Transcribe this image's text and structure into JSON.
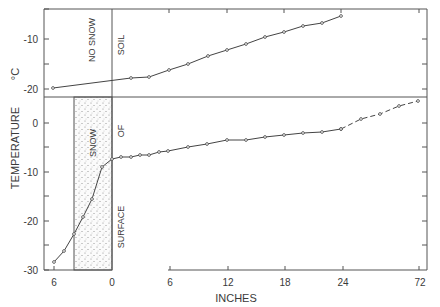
{
  "chart_data": {
    "type": "line",
    "title": "",
    "xlabel": "INCHES",
    "ylabel": "TEMPERATURE °C",
    "grid": false,
    "legend": null,
    "panels": [
      {
        "name": "no-snow",
        "ylim": [
          -24,
          -4
        ],
        "yticks": [
          -10,
          -20
        ],
        "ytick_labels": [
          "-10",
          "-20"
        ],
        "annotations": [
          "NO SNOW",
          "SOIL"
        ],
        "series": [
          {
            "name": "Temperature profile, no snow cover",
            "style": "solid",
            "x": [
              -6,
              2,
              4,
              6,
              8,
              10,
              12,
              14,
              16,
              18,
              20,
              22,
              24
            ],
            "values": [
              -19.8,
              -17.8,
              -17.6,
              -16.2,
              -15.0,
              -13.4,
              -12.2,
              -11.0,
              -9.6,
              -8.6,
              -7.4,
              -6.8,
              -5.4
            ]
          }
        ]
      },
      {
        "name": "with-snow",
        "ylim": [
          -30,
          3
        ],
        "yticks": [
          0,
          -10,
          -20,
          -30
        ],
        "ytick_labels": [
          "0",
          "-10",
          "-20",
          "-30"
        ],
        "annotations": [
          "SNOW",
          "SURFACE OF SOIL"
        ],
        "snow_region_inches": [
          -4,
          0
        ],
        "series": [
          {
            "name": "Temperature profile, snow cover",
            "style": "solid",
            "x": [
              -6,
              -5,
              -4,
              -3,
              -2,
              -1,
              0,
              1,
              2,
              3,
              4,
              5,
              6,
              8,
              10,
              12,
              14,
              16,
              18,
              20,
              22,
              24
            ],
            "values": [
              -28.4,
              -26.1,
              -22.7,
              -19.2,
              -15.5,
              -9.0,
              -7.3,
              -6.9,
              -6.9,
              -6.5,
              -6.5,
              -5.9,
              -5.7,
              -4.9,
              -4.3,
              -3.5,
              -3.5,
              -2.9,
              -2.4,
              -2.0,
              -1.8,
              -1.2
            ]
          },
          {
            "name": "Temperature profile, snow cover (extrapolated)",
            "style": "dashed",
            "x": [
              24,
              36,
              48,
              60,
              72
            ],
            "values": [
              -1.2,
              0.8,
              1.8,
              3.5,
              4.5
            ]
          }
        ]
      }
    ],
    "x_tick_labels_left": [
      "6",
      "0"
    ],
    "x_tick_labels_right": [
      "6",
      "12",
      "18",
      "24",
      "72"
    ]
  },
  "labels": {
    "y_axis": "TEMPERATURE",
    "y_unit": "°C",
    "x_axis": "INCHES",
    "no_snow": "NO SNOW",
    "soil": "SOIL",
    "snow": "SNOW",
    "of": "OF",
    "surface": "SURFACE"
  },
  "geometry": {
    "top_points": [
      [
        53,
        88
      ],
      [
        131,
        78
      ],
      [
        149,
        77
      ],
      [
        169,
        70
      ],
      [
        188,
        64
      ],
      [
        208,
        56
      ],
      [
        227,
        50
      ],
      [
        246,
        44
      ],
      [
        265,
        37
      ],
      [
        284,
        32
      ],
      [
        303,
        26
      ],
      [
        322,
        23
      ],
      [
        341,
        16
      ]
    ],
    "bottom_points": [
      [
        54,
        262
      ],
      [
        64,
        251
      ],
      [
        74,
        234
      ],
      [
        83,
        217
      ],
      [
        92,
        199
      ],
      [
        102,
        167
      ],
      [
        112,
        159
      ],
      [
        121,
        157
      ],
      [
        131,
        157
      ],
      [
        140,
        155
      ],
      [
        149,
        155
      ],
      [
        159,
        152
      ],
      [
        168,
        151
      ],
      [
        188,
        147
      ],
      [
        207,
        144
      ],
      [
        227,
        140
      ],
      [
        246,
        140
      ],
      [
        265,
        137
      ],
      [
        284,
        135
      ],
      [
        303,
        133
      ],
      [
        322,
        132
      ],
      [
        341,
        129
      ]
    ],
    "dashed_points": [
      [
        341,
        129
      ],
      [
        361,
        119
      ],
      [
        380,
        114
      ],
      [
        399,
        106
      ],
      [
        418,
        101
      ]
    ]
  }
}
